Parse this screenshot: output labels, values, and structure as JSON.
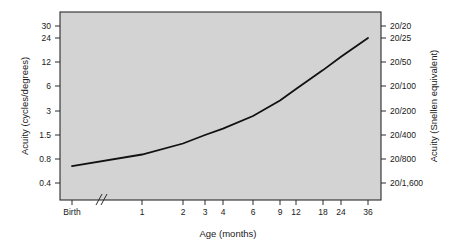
{
  "chart_data": {
    "type": "line",
    "title": "",
    "xlabel": "Age (months)",
    "ylabel": "Acuity (cycles/degrees)",
    "y2label": "Acuity (Snellen equivalent)",
    "grid": false,
    "legend": null,
    "x_tick_labels": [
      "Birth",
      "1",
      "2",
      "3",
      "4",
      "6",
      "9",
      "12",
      "18",
      "24",
      "36"
    ],
    "x_axis_break": "//",
    "x_axis_break_note": "axis break between Birth and 1 month",
    "y_tick_labels": [
      "30",
      "24",
      "12",
      "6",
      "3",
      "1.5",
      "0.8",
      "0.4"
    ],
    "y_tick_values": [
      30,
      24,
      12,
      6,
      3,
      1.5,
      0.8,
      0.4
    ],
    "y2_tick_labels": [
      "20/20",
      "20/25",
      "20/50",
      "20/100",
      "20/200",
      "20/400",
      "20/800",
      "20/1,600"
    ],
    "ylim": [
      0.4,
      30
    ],
    "y_scale": "log",
    "series": [
      {
        "name": "Visual acuity development",
        "x": [
          "Birth",
          "1",
          "2",
          "3",
          "4",
          "6",
          "9",
          "12",
          "18",
          "24",
          "36"
        ],
        "values": [
          0.65,
          0.9,
          1.2,
          1.5,
          1.8,
          2.6,
          4.0,
          5.5,
          9.5,
          14.0,
          24.0
        ],
        "snellen": [
          "20/900",
          "20/650",
          "20/490",
          "20/400",
          "20/330",
          "20/230",
          "20/150",
          "20/110",
          "20/63",
          "20/43",
          "20/25"
        ],
        "color": "#111111"
      }
    ],
    "annotations": []
  },
  "axes": {
    "left_title": "Acuity (cycles/degrees)",
    "right_title": "Acuity (Snellen equivalent)",
    "bottom_title": "Age (months)"
  },
  "colors": {
    "plot_background": "#d3d3d3",
    "page_background": "#ffffff",
    "line": "#111111",
    "axis": "#2b2b2b",
    "text": "#1a1a1a"
  }
}
